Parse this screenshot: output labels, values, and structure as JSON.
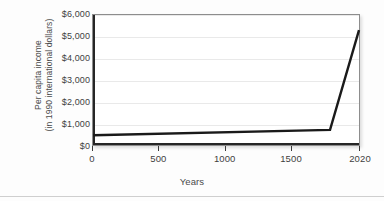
{
  "chart_data": {
    "type": "line",
    "title": "",
    "xlabel": "Years",
    "ylabel": "Per capita income (in 1990 international dollars)",
    "ylabel_line1": "Per capita income",
    "ylabel_line2": "(in 1990 international dollars)",
    "x": [
      0,
      1800,
      2020
    ],
    "values": [
      450,
      700,
      5300
    ],
    "series": [
      {
        "name": "Per capita income",
        "x": [
          0,
          1800,
          2020
        ],
        "values": [
          450,
          700,
          5300
        ]
      }
    ],
    "xlim": [
      0,
      2020
    ],
    "ylim": [
      0,
      6000
    ],
    "xticks": [
      0,
      500,
      1000,
      1500,
      2020
    ],
    "xtick_labels": [
      "0",
      "500",
      "1000",
      "1500",
      "2020"
    ],
    "yticks": [
      0,
      1000,
      2000,
      3000,
      4000,
      5000,
      6000
    ],
    "ytick_labels": [
      "$0",
      "$1,000",
      "$2,000",
      "$3,000",
      "$4,000",
      "$5,000",
      "$6,000"
    ],
    "grid": true,
    "grid_axis": "y",
    "legend": false,
    "legend_position": "none",
    "line_color": "#1a1a1a",
    "grid_color": "#e9e9e9",
    "axis_color": "#262626",
    "plot_background": "#ffffff",
    "figure_background": "#fdfdfd"
  }
}
